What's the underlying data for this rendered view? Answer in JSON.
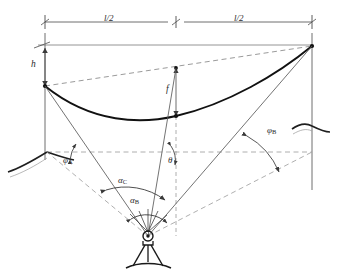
{
  "figure": {
    "kind": "engineering-survey-diagram",
    "background_color": "#ffffff",
    "line_color": "#3a3a3a",
    "cable_color": "#1a1a1a",
    "dash_color": "#8a8a8a"
  },
  "dimensions": {
    "left_span_label": "l/2",
    "right_span_label": "l/2",
    "height_label": "h",
    "sag_label": "f"
  },
  "angles": {
    "phi_a": {
      "symbol": "φ",
      "subscript": "A"
    },
    "phi_b": {
      "symbol": "φ",
      "subscript": "B"
    },
    "alpha_b": {
      "symbol": "α",
      "subscript": "B"
    },
    "alpha_c": {
      "symbol": "α",
      "subscript": "C"
    },
    "theta": {
      "symbol": "θ",
      "subscript": ""
    }
  },
  "nodes": {
    "left_anchor": "left-cable-anchor",
    "right_anchor": "right-cable-anchor",
    "midspan_chord_point": "chord-midpoint",
    "midspan_cable_point": "cable-lowest-point",
    "instrument_station": "instrument-station"
  }
}
